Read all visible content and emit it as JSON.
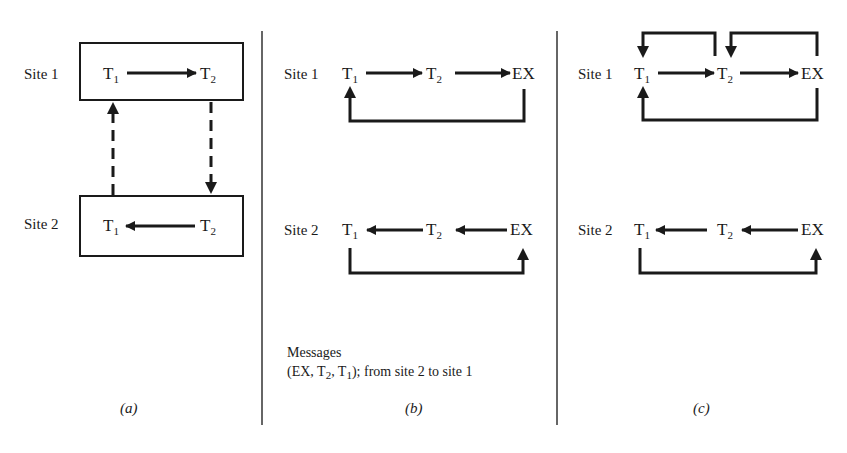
{
  "panels": {
    "a": {
      "caption": "(a)",
      "site1": {
        "label": "Site 1",
        "t1": "T",
        "t1_sub": "1",
        "t2": "T",
        "t2_sub": "2"
      },
      "site2": {
        "label": "Site 2",
        "t1": "T",
        "t1_sub": "1",
        "t2": "T",
        "t2_sub": "2"
      }
    },
    "b": {
      "caption": "(b)",
      "site1": {
        "label": "Site 1",
        "t1": "T",
        "t1_sub": "1",
        "t2": "T",
        "t2_sub": "2",
        "ex": "EX"
      },
      "site2": {
        "label": "Site 2",
        "t1": "T",
        "t1_sub": "1",
        "t2": "T",
        "t2_sub": "2",
        "ex": "EX"
      },
      "messages_title": "Messages",
      "messages_pre": "(EX, T",
      "messages_sub1": "2",
      "messages_mid": ", T",
      "messages_sub2": "1",
      "messages_post": "); from site 2 to site 1"
    },
    "c": {
      "caption": "(c)",
      "site1": {
        "label": "Site 1",
        "t1": "T",
        "t1_sub": "1",
        "t2": "T",
        "t2_sub": "2",
        "ex": "EX"
      },
      "site2": {
        "label": "Site 2",
        "t1": "T",
        "t1_sub": "1",
        "t2": "T",
        "t2_sub": "2",
        "ex": "EX"
      }
    }
  }
}
